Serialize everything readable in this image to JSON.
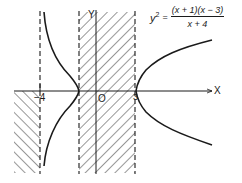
{
  "figure": {
    "equation": {
      "lhs_var": "y",
      "lhs_exp": "2",
      "equals": "=",
      "numerator": "(x + 1)(x − 3)",
      "denominator": "x + 4"
    },
    "axes": {
      "x_label": "X",
      "y_label": "Y",
      "origin_label": "O"
    },
    "tick_labels": {
      "minus_four": "−4",
      "minus_one": "",
      "three": "3"
    },
    "colors": {
      "ink": "#1a1a1a",
      "background": "#ffffff"
    }
  },
  "diagram_data": {
    "type": "curve-sketch",
    "function": "y^2 = (x+1)(x-3)/(x+4)",
    "vertical_asymptote": -4,
    "x_intercepts": [
      -1,
      3
    ],
    "dashed_lines_x": [
      -4,
      -1,
      3
    ],
    "excluded_regions": [
      {
        "description": "x < -4, shaded below axis (hatched)",
        "x_range": [
          null,
          -4
        ]
      },
      {
        "description": "-1 < x < 3, shaded (hatched)",
        "x_range": [
          -1,
          3
        ]
      }
    ],
    "branches": [
      "left branch between x=-4 and x=-1, approaching asymptote x=-4 above and below",
      "right branch for x >= 3, opening rightward"
    ]
  }
}
